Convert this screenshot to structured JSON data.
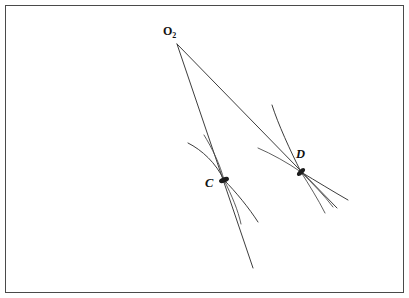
{
  "figure": {
    "kind": "geometry-diagram",
    "width": 409,
    "height": 298,
    "background_color": "#ffffff",
    "stroke_color": "#3d3d3d",
    "frame": {
      "present": true,
      "color": "#4a4a4a",
      "x": 5,
      "y": 5,
      "width": 399,
      "height": 288
    },
    "points": [
      {
        "id": "O2",
        "label_main": "O",
        "label_sub": "2",
        "x": 177,
        "y": 44,
        "label_x": 163,
        "label_y": 25,
        "style": "upright"
      },
      {
        "id": "C",
        "label_main": "C",
        "label_sub": "",
        "x": 224,
        "y": 180,
        "label_x": 205,
        "label_y": 177,
        "style": "italic"
      },
      {
        "id": "D",
        "label_main": "D",
        "label_sub": "",
        "x": 301,
        "y": 172,
        "label_x": 296,
        "label_y": 148,
        "style": "italic"
      }
    ],
    "rays": [
      {
        "id": "ray-o2-c",
        "from": "O2",
        "through": "C",
        "path": "M 177 44 L 253 268"
      },
      {
        "id": "ray-o2-d",
        "from": "O2",
        "through": "D",
        "path": "M 177 44 L 337 208"
      }
    ],
    "arcs": [
      {
        "id": "arc-c-upper-left",
        "near": "C",
        "path": "M 188 143 C 202 150 216 163 224 180"
      },
      {
        "id": "arc-c-upper-inner",
        "near": "C",
        "path": "M 204 135 C 212 148 220 164 224 180"
      },
      {
        "id": "arc-c-lower-outer",
        "near": "C",
        "path": "M 224 180 C 236 192 249 208 258 222"
      },
      {
        "id": "arc-c-lower-inner",
        "near": "C",
        "path": "M 224 180 C 232 196 238 210 241 224"
      },
      {
        "id": "arc-d-upper-steep",
        "near": "D",
        "path": "M 272 105 C 278 124 290 150 301 172"
      },
      {
        "id": "arc-d-upper-shallow",
        "near": "D",
        "path": "M 258 148 C 272 154 288 163 301 172"
      },
      {
        "id": "arc-d-lower-outer",
        "near": "D",
        "path": "M 301 172 C 316 181 334 192 348 200"
      },
      {
        "id": "arc-d-lower-middle",
        "near": "D",
        "path": "M 301 172 C 312 183 324 195 333 207"
      },
      {
        "id": "arc-d-lower-inner",
        "near": "D",
        "path": "M 301 172 C 309 185 318 199 325 213"
      }
    ]
  }
}
